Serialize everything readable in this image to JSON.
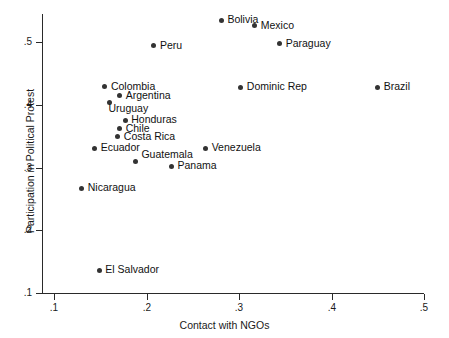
{
  "chart_data": {
    "type": "scatter",
    "title": "",
    "xlabel": "Contact with NGOs",
    "ylabel": "Participation in Political Protest",
    "xlim": [
      0.1,
      0.5
    ],
    "ylim": [
      0.1,
      0.55
    ],
    "xticks": [
      ".1",
      ".2",
      ".3",
      ".4",
      ".5"
    ],
    "xtick_values": [
      0.1,
      0.2,
      0.3,
      0.4,
      0.5
    ],
    "yticks": [
      ".1",
      ".2",
      ".3",
      ".4",
      ".5"
    ],
    "ytick_values": [
      0.1,
      0.2,
      0.3,
      0.4,
      0.5
    ],
    "grid": false,
    "legend": null,
    "points": [
      {
        "label": "Bolivia",
        "x": 0.281,
        "y": 0.535,
        "label_pos": "right"
      },
      {
        "label": "Mexico",
        "x": 0.317,
        "y": 0.526,
        "label_pos": "right"
      },
      {
        "label": "Paraguay",
        "x": 0.344,
        "y": 0.497,
        "label_pos": "right"
      },
      {
        "label": "Peru",
        "x": 0.208,
        "y": 0.494,
        "label_pos": "right"
      },
      {
        "label": "Colombia",
        "x": 0.155,
        "y": 0.429,
        "label_pos": "right"
      },
      {
        "label": "Dominic Rep",
        "x": 0.302,
        "y": 0.428,
        "label_pos": "right"
      },
      {
        "label": "Brazil",
        "x": 0.45,
        "y": 0.428,
        "label_pos": "right"
      },
      {
        "label": "Argentina",
        "x": 0.171,
        "y": 0.414,
        "label_pos": "right"
      },
      {
        "label": "Uruguay",
        "x": 0.16,
        "y": 0.404,
        "label_pos": "below-right"
      },
      {
        "label": "Honduras",
        "x": 0.177,
        "y": 0.375,
        "label_pos": "right"
      },
      {
        "label": "Chile",
        "x": 0.171,
        "y": 0.362,
        "label_pos": "right"
      },
      {
        "label": "Costa Rica",
        "x": 0.169,
        "y": 0.349,
        "label_pos": "right"
      },
      {
        "label": "Ecuador",
        "x": 0.144,
        "y": 0.331,
        "label_pos": "right"
      },
      {
        "label": "Venezuela",
        "x": 0.264,
        "y": 0.331,
        "label_pos": "right"
      },
      {
        "label": "Guatemala",
        "x": 0.188,
        "y": 0.309,
        "label_pos": "above-right"
      },
      {
        "label": "Panama",
        "x": 0.227,
        "y": 0.302,
        "label_pos": "right"
      },
      {
        "label": "Nicaragua",
        "x": 0.13,
        "y": 0.267,
        "label_pos": "right"
      },
      {
        "label": "El Salvador",
        "x": 0.149,
        "y": 0.136,
        "label_pos": "right"
      }
    ]
  },
  "colors": {
    "marker": "#333333",
    "axis": "#2a2a2a",
    "text": "#111111",
    "background": "#ffffff"
  }
}
